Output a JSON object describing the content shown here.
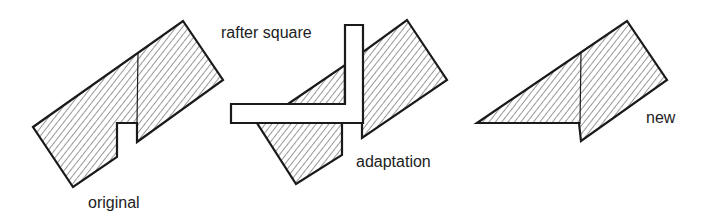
{
  "figure": {
    "labels": {
      "original": "original",
      "rafter_square": "rafter square",
      "adaptation": "adaptation",
      "new": "new"
    },
    "colors": {
      "stroke": "#1a1a1a",
      "hatch": "#333333",
      "background": "#ffffff"
    }
  }
}
